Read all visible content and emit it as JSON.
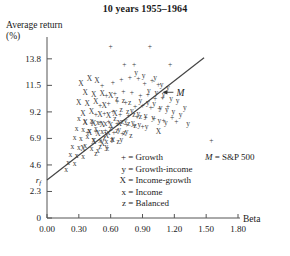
{
  "chart_data": {
    "type": "scatter",
    "title": "10 years 1955–1964",
    "xlabel": "Beta",
    "ylabel": "Average return (%)",
    "xlim": [
      0.0,
      1.8
    ],
    "ylim": [
      0.0,
      15.0
    ],
    "xticks": [
      "0.00",
      "0.30",
      "0.60",
      "0.90",
      "1.20",
      "1.50",
      "1.80"
    ],
    "xtick_values": [
      0.0,
      0.3,
      0.6,
      0.9,
      1.2,
      1.5,
      1.8
    ],
    "yticks": [
      "0",
      "2.3",
      "4.6",
      "6.9",
      "9.2",
      "11.5",
      "13.8"
    ],
    "ytick_values": [
      0.0,
      2.3,
      4.6,
      6.9,
      9.2,
      11.5,
      13.8
    ],
    "grid": false,
    "legend_position": "inside-lower-center",
    "annotations": [
      {
        "text": "M",
        "x": 1.21,
        "y": 10.9,
        "note": "market portfolio on capital market line, arrow points left to line"
      },
      {
        "text": "r_f",
        "x": 0.0,
        "y": 3.3,
        "note": "risk-free rate, y-axis intercept of line"
      }
    ],
    "line": {
      "name": "capital market line",
      "x0": 0.0,
      "y0": 3.3,
      "x1": 1.48,
      "y1": 13.9
    },
    "legend": [
      {
        "symbol": "+",
        "label": "Growth"
      },
      {
        "symbol": "y",
        "label": "Growth-income"
      },
      {
        "symbol": "X",
        "label": "Income-growth"
      },
      {
        "symbol": "x",
        "label": "Income"
      },
      {
        "symbol": "z",
        "label": "Balanced"
      }
    ],
    "market_note": {
      "symbol": "M",
      "label": "S&P 500"
    },
    "series": [
      {
        "name": "Growth",
        "symbol": "+",
        "points": [
          [
            0.6,
            14.9
          ],
          [
            0.97,
            14.9
          ],
          [
            0.73,
            13.3
          ],
          [
            0.82,
            13.3
          ],
          [
            1.16,
            13.3
          ],
          [
            0.52,
            11.5
          ],
          [
            0.62,
            11.8
          ],
          [
            0.7,
            12.0
          ],
          [
            0.78,
            12.2
          ],
          [
            0.86,
            12.1
          ],
          [
            0.92,
            11.7
          ],
          [
            0.99,
            11.9
          ],
          [
            1.05,
            11.6
          ],
          [
            0.56,
            10.6
          ],
          [
            0.64,
            10.8
          ],
          [
            0.72,
            11.0
          ],
          [
            0.8,
            10.9
          ],
          [
            0.88,
            10.6
          ],
          [
            0.95,
            10.7
          ],
          [
            1.02,
            10.4
          ],
          [
            1.09,
            10.5
          ],
          [
            0.5,
            9.8
          ],
          [
            0.58,
            9.9
          ],
          [
            0.66,
            10.1
          ],
          [
            0.74,
            10.0
          ],
          [
            0.83,
            9.7
          ],
          [
            0.9,
            9.8
          ],
          [
            0.98,
            9.6
          ],
          [
            1.06,
            9.5
          ],
          [
            1.14,
            9.7
          ],
          [
            0.46,
            9.0
          ],
          [
            0.54,
            9.1
          ],
          [
            0.62,
            9.2
          ],
          [
            0.69,
            9.0
          ],
          [
            0.77,
            8.9
          ],
          [
            0.85,
            8.8
          ],
          [
            0.93,
            8.7
          ],
          [
            1.01,
            8.6
          ],
          [
            1.1,
            8.5
          ],
          [
            1.18,
            8.7
          ],
          [
            0.42,
            8.2
          ],
          [
            0.5,
            8.3
          ],
          [
            0.58,
            8.4
          ],
          [
            0.66,
            8.2
          ],
          [
            0.75,
            8.1
          ],
          [
            0.82,
            8.0
          ],
          [
            0.9,
            7.9
          ],
          [
            1.22,
            8.4
          ],
          [
            0.38,
            7.4
          ],
          [
            0.46,
            7.5
          ],
          [
            0.55,
            7.6
          ],
          [
            0.63,
            7.4
          ],
          [
            0.71,
            7.3
          ],
          [
            1.55,
            6.7
          ]
        ]
      },
      {
        "name": "Growth-income",
        "symbol": "y",
        "points": [
          [
            0.84,
            12.6
          ],
          [
            0.91,
            12.4
          ],
          [
            1.02,
            12.2
          ],
          [
            1.08,
            11.6
          ],
          [
            1.14,
            11.3
          ],
          [
            0.96,
            11.1
          ],
          [
            1.03,
            10.9
          ],
          [
            1.1,
            10.7
          ],
          [
            1.17,
            10.4
          ],
          [
            1.23,
            10.2
          ],
          [
            0.88,
            10.2
          ],
          [
            0.95,
            10.0
          ],
          [
            1.01,
            9.9
          ],
          [
            1.07,
            9.6
          ],
          [
            1.13,
            9.4
          ],
          [
            1.19,
            9.2
          ],
          [
            1.26,
            9.0
          ],
          [
            0.8,
            9.3
          ],
          [
            0.86,
            9.1
          ],
          [
            0.93,
            8.9
          ],
          [
            1.0,
            8.7
          ],
          [
            1.06,
            8.5
          ],
          [
            1.12,
            8.3
          ],
          [
            1.3,
            9.6
          ],
          [
            0.74,
            8.5
          ],
          [
            0.81,
            8.3
          ],
          [
            0.87,
            8.1
          ],
          [
            0.94,
            7.9
          ],
          [
            0.68,
            7.7
          ],
          [
            0.75,
            7.5
          ],
          [
            1.33,
            8.2
          ],
          [
            0.62,
            6.9
          ],
          [
            0.7,
            6.8
          ],
          [
            0.56,
            6.2
          ]
        ]
      },
      {
        "name": "Income-growth",
        "symbol": "X",
        "points": [
          [
            0.32,
            11.7
          ],
          [
            0.4,
            12.1
          ],
          [
            0.47,
            11.9
          ],
          [
            0.36,
            10.9
          ],
          [
            0.44,
            10.7
          ],
          [
            0.52,
            10.8
          ],
          [
            0.6,
            10.6
          ],
          [
            0.3,
            10.0
          ],
          [
            0.38,
            9.9
          ],
          [
            0.46,
            10.1
          ],
          [
            0.54,
            9.8
          ],
          [
            0.34,
            9.1
          ],
          [
            0.42,
            9.2
          ],
          [
            0.5,
            9.0
          ],
          [
            0.58,
            8.9
          ],
          [
            0.64,
            9.1
          ],
          [
            0.36,
            8.3
          ],
          [
            0.44,
            8.2
          ],
          [
            0.52,
            8.1
          ],
          [
            0.6,
            8.0
          ],
          [
            0.68,
            8.2
          ],
          [
            0.4,
            7.4
          ],
          [
            0.48,
            7.3
          ],
          [
            0.56,
            7.2
          ],
          [
            1.05,
            7.5
          ],
          [
            0.44,
            6.6
          ],
          [
            0.52,
            6.5
          ],
          [
            0.34,
            6.0
          ]
        ]
      },
      {
        "name": "Income",
        "symbol": "x",
        "points": [
          [
            0.3,
            8.6
          ],
          [
            0.36,
            8.4
          ],
          [
            0.42,
            8.5
          ],
          [
            0.48,
            8.3
          ],
          [
            0.55,
            8.2
          ],
          [
            0.28,
            7.8
          ],
          [
            0.34,
            7.7
          ],
          [
            0.4,
            7.6
          ],
          [
            0.46,
            7.8
          ],
          [
            0.52,
            7.5
          ],
          [
            0.58,
            7.4
          ],
          [
            0.26,
            7.0
          ],
          [
            0.32,
            6.9
          ],
          [
            0.38,
            7.1
          ],
          [
            0.44,
            6.8
          ],
          [
            0.5,
            6.7
          ],
          [
            0.56,
            6.6
          ],
          [
            0.62,
            6.8
          ],
          [
            0.24,
            6.2
          ],
          [
            0.3,
            6.1
          ],
          [
            0.36,
            6.3
          ],
          [
            0.42,
            6.0
          ],
          [
            0.48,
            5.9
          ],
          [
            0.22,
            5.5
          ],
          [
            0.28,
            5.4
          ],
          [
            0.34,
            5.3
          ],
          [
            0.2,
            4.8
          ],
          [
            0.26,
            4.7
          ],
          [
            0.18,
            4.2
          ]
        ]
      },
      {
        "name": "Balanced",
        "symbol": "z",
        "points": [
          [
            0.66,
            10.4
          ],
          [
            0.72,
            10.2
          ],
          [
            0.78,
            10.0
          ],
          [
            0.7,
            9.4
          ],
          [
            0.76,
            9.2
          ],
          [
            0.82,
            9.0
          ],
          [
            0.88,
            8.8
          ],
          [
            0.64,
            8.6
          ],
          [
            0.71,
            8.4
          ],
          [
            0.77,
            8.2
          ],
          [
            0.83,
            8.0
          ],
          [
            0.6,
            7.8
          ],
          [
            0.66,
            7.6
          ],
          [
            0.73,
            7.4
          ],
          [
            0.79,
            7.2
          ],
          [
            0.54,
            7.0
          ],
          [
            0.61,
            6.8
          ],
          [
            0.67,
            6.6
          ],
          [
            0.5,
            6.2
          ],
          [
            0.57,
            6.0
          ],
          [
            0.46,
            5.6
          ]
        ]
      }
    ]
  },
  "title": "10 years 1955–1964",
  "axes": {
    "y_label_line1": "Average return",
    "y_label_line2": "(%)",
    "x_label": "Beta",
    "rf_label": "r",
    "rf_sub": "f"
  },
  "legend": {
    "growth_symbol": "+",
    "growth_eq": "= Growth",
    "growth_income_symbol": "y",
    "growth_income_eq": "= Growth-income",
    "income_growth_symbol": "X",
    "income_growth_eq": "= Income-growth",
    "income_symbol": "x",
    "income_eq": "= Income",
    "balanced_symbol": "z",
    "balanced_eq": "= Balanced",
    "market_symbol": "M",
    "market_eq": "= S&P 500"
  },
  "market_point_label": "M"
}
